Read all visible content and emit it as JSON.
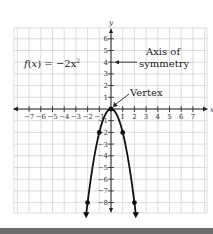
{
  "chart_data": {
    "type": "line",
    "title": "",
    "function_label": "f(x) = −2x²",
    "function_label_parts": {
      "f": "f",
      "x": "x",
      "rhs": "= −2x",
      "exp": "2"
    },
    "xlabel": "x",
    "ylabel": "y",
    "xlim": [
      -8,
      8.5
    ],
    "ylim": [
      -9,
      7
    ],
    "grid": true,
    "x_ticks": [
      -7,
      -6,
      -5,
      -4,
      -3,
      -2,
      -1,
      1,
      2,
      3,
      4,
      5,
      6,
      7
    ],
    "x_tick_labels": [
      "−7",
      "−6",
      "−5",
      "−4",
      "−3",
      "−2",
      "−1",
      "1",
      "2",
      "3",
      "4",
      "5",
      "6",
      "7"
    ],
    "y_ticks": [
      6,
      5,
      4,
      3,
      2,
      1,
      -1,
      -2,
      -3,
      -4,
      -5,
      -6,
      -7,
      -8
    ],
    "y_tick_labels": [
      "6",
      "5",
      "4",
      "3",
      "2",
      "1",
      "−1",
      "−2",
      "−3",
      "−4",
      "−5",
      "−6",
      "−7",
      "−8"
    ],
    "series": [
      {
        "name": "f(x) = -2x^2",
        "x": [
          -2,
          -1,
          0,
          1,
          2
        ],
        "y": [
          -8,
          -2,
          0,
          -2,
          -8
        ],
        "curve_extends_beyond": true
      }
    ],
    "annotations": [
      {
        "text_lines": [
          "Axis of",
          "symmetry"
        ],
        "points_to": [
          0,
          4
        ]
      },
      {
        "text_lines": [
          "Vertex"
        ],
        "points_to": [
          0,
          0
        ]
      }
    ]
  }
}
